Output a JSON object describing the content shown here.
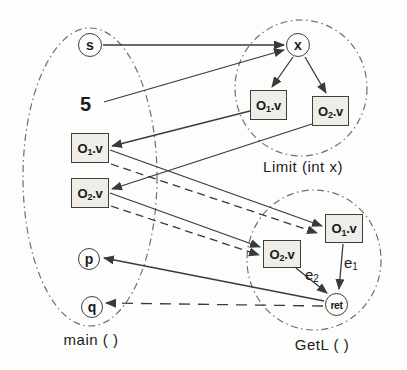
{
  "diagram": {
    "groups": {
      "main": {
        "label": "main ( )"
      },
      "limit": {
        "label": "Limit (int x)"
      },
      "getl": {
        "label": "GetL ( )"
      }
    },
    "nodes": {
      "s": {
        "label": "s"
      },
      "x": {
        "label": "x"
      },
      "five": {
        "label": "5"
      },
      "p": {
        "label": "p"
      },
      "q": {
        "label": "q"
      },
      "ret": {
        "label": "ret"
      },
      "main_o1v": {
        "base": "O",
        "sub": "1",
        "suffix": ".v"
      },
      "main_o2v": {
        "base": "O",
        "sub": "2",
        "suffix": ".v"
      },
      "limit_o1v": {
        "base": "O",
        "sub": "1",
        "suffix": ".v"
      },
      "limit_o2v": {
        "base": "O",
        "sub": "2",
        "suffix": ".v"
      },
      "getl_o1v": {
        "base": "O",
        "sub": "1",
        "suffix": ".v"
      },
      "getl_o2v": {
        "base": "O",
        "sub": "2",
        "suffix": ".v"
      }
    },
    "edge_labels": {
      "e1": {
        "base": "e",
        "sub": "1"
      },
      "e2": {
        "base": "e",
        "sub": "2"
      }
    },
    "edges": [
      {
        "from": "main.s",
        "to": "limit.x",
        "style": "solid"
      },
      {
        "from": "main.5",
        "to": "limit.x",
        "style": "solid"
      },
      {
        "from": "limit.x",
        "to": "limit.O1.v",
        "style": "solid"
      },
      {
        "from": "limit.x",
        "to": "limit.O2.v",
        "style": "solid"
      },
      {
        "from": "limit.O1.v",
        "to": "main.O1.v",
        "style": "solid"
      },
      {
        "from": "limit.O2.v",
        "to": "main.O2.v",
        "style": "solid"
      },
      {
        "from": "main.O1.v",
        "to": "getl.O1.v",
        "style": "solid"
      },
      {
        "from": "main.O2.v",
        "to": "getl.O2.v",
        "style": "solid"
      },
      {
        "from": "main.O1.v",
        "to": "getl.O1.v",
        "style": "dashed"
      },
      {
        "from": "main.O2.v",
        "to": "getl.O2.v",
        "style": "dashed"
      },
      {
        "from": "getl.O1.v",
        "to": "getl.ret",
        "style": "solid",
        "label": "e1"
      },
      {
        "from": "getl.O2.v",
        "to": "getl.ret",
        "style": "solid",
        "label": "e2"
      },
      {
        "from": "getl.ret",
        "to": "main.p",
        "style": "solid"
      },
      {
        "from": "getl.ret",
        "to": "main.q",
        "style": "dashed"
      }
    ],
    "colors": {
      "background": "#fdfdfc",
      "line": "#3a3a3a",
      "region_outline": "#6f6f6f",
      "box_fill": "#efede8",
      "node_border": "#3f3f3f",
      "text": "#1b1b1b"
    }
  }
}
